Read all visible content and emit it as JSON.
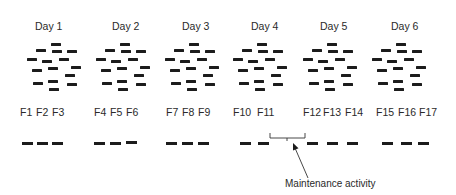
{
  "diagram": {
    "days": [
      {
        "label": "Day 1",
        "label_x": 35,
        "cluster_x": 27
      },
      {
        "label": "Day 2",
        "label_x": 112,
        "cluster_x": 96
      },
      {
        "label": "Day 3",
        "label_x": 182,
        "cluster_x": 165
      },
      {
        "label": "Day 4",
        "label_x": 251,
        "cluster_x": 233
      },
      {
        "label": "Day 5",
        "label_x": 320,
        "cluster_x": 303
      },
      {
        "label": "Day 6",
        "label_x": 391,
        "cluster_x": 372
      }
    ],
    "cluster_pattern": [
      [
        24,
        43
      ],
      [
        9,
        49
      ],
      [
        25,
        50
      ],
      [
        40,
        50
      ],
      [
        0,
        58
      ],
      [
        15,
        60
      ],
      [
        32,
        58
      ],
      [
        5,
        69
      ],
      [
        21,
        67
      ],
      [
        44,
        66
      ],
      [
        38,
        74
      ],
      [
        6,
        82
      ],
      [
        21,
        80
      ],
      [
        40,
        83
      ],
      [
        22,
        88
      ]
    ],
    "fractions": [
      {
        "label": "F1",
        "label_x": 20,
        "dash_x": 22,
        "dash_y": 142
      },
      {
        "label": "F2",
        "label_x": 36,
        "dash_x": 37,
        "dash_y": 142
      },
      {
        "label": "F3",
        "label_x": 52,
        "dash_x": 52,
        "dash_y": 142
      },
      {
        "label": "F4",
        "label_x": 94,
        "dash_x": 94,
        "dash_y": 142
      },
      {
        "label": "F5",
        "label_x": 110,
        "dash_x": 110,
        "dash_y": 142
      },
      {
        "label": "F6",
        "label_x": 126,
        "dash_x": 126,
        "dash_y": 141
      },
      {
        "label": "F7",
        "label_x": 166,
        "dash_x": 166,
        "dash_y": 142
      },
      {
        "label": "F8",
        "label_x": 182,
        "dash_x": 182,
        "dash_y": 142
      },
      {
        "label": "F9",
        "label_x": 198,
        "dash_x": 198,
        "dash_y": 142
      },
      {
        "label": "F10",
        "label_x": 233,
        "dash_x": 240,
        "dash_y": 142
      },
      {
        "label": "F11",
        "label_x": 257,
        "dash_x": 258,
        "dash_y": 142
      },
      {
        "label": "F12",
        "label_x": 303,
        "dash_x": 307,
        "dash_y": 142
      },
      {
        "label": "F13",
        "label_x": 323,
        "dash_x": 327,
        "dash_y": 142
      },
      {
        "label": "F14",
        "label_x": 345,
        "dash_x": 347,
        "dash_y": 142
      },
      {
        "label": "F15",
        "label_x": 376,
        "dash_x": 382,
        "dash_y": 142
      },
      {
        "label": "F16",
        "label_x": 398,
        "dash_x": 401,
        "dash_y": 142
      },
      {
        "label": "F17",
        "label_x": 419,
        "dash_x": 418,
        "dash_y": 142
      }
    ],
    "annotation": {
      "label": "Maintenance activity",
      "bracket": {
        "x1": 270,
        "x2": 305,
        "top": 133,
        "bottom": 138,
        "tick_x": 287,
        "tick_bottom": 141
      },
      "arrow": {
        "from": [
          308,
          178
        ],
        "to": [
          293,
          143
        ]
      }
    },
    "colors": {
      "ink": "#1c1c1c",
      "text": "#2a2a2a",
      "background": "#ffffff"
    }
  }
}
